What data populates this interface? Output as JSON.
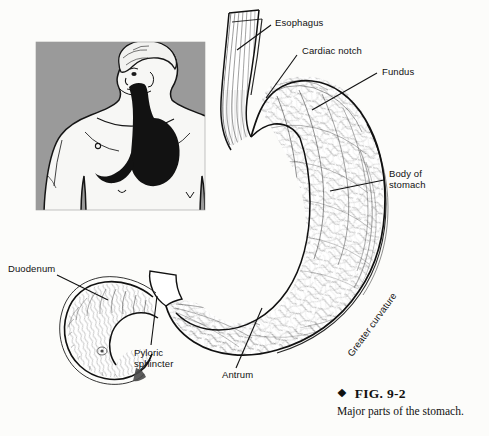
{
  "figure": {
    "title": "Major parts of the stomach",
    "caption_marker": "❖",
    "caption_number": "FIG. 9-2",
    "caption_text": "Major parts of the stomach.",
    "background_color": "#fcfcfa",
    "ink_color": "#111111",
    "inset_background_color": "#9a9a9a"
  },
  "labels": {
    "esophagus": "Esophagus",
    "cardiac_notch": "Cardiac notch",
    "fundus": "Fundus",
    "body_of_stomach": "Body of\nstomach",
    "greater_curvature": "Greater curvature",
    "antrum": "Antrum",
    "pyloric_sphincter": "Pyloric\nsphincter",
    "duodenum": "Duodenum"
  },
  "inset": {
    "name": "human torso orientation inset",
    "description": "Gray panel showing a human torso with esophagus and stomach shaded black"
  },
  "structures": [
    {
      "id": "esophagus",
      "name": "Esophagus"
    },
    {
      "id": "cardiac-notch",
      "name": "Cardiac notch"
    },
    {
      "id": "fundus",
      "name": "Fundus"
    },
    {
      "id": "body",
      "name": "Body of stomach"
    },
    {
      "id": "greater-curvature",
      "name": "Greater curvature"
    },
    {
      "id": "antrum",
      "name": "Antrum"
    },
    {
      "id": "pyloric-sphincter",
      "name": "Pyloric sphincter"
    },
    {
      "id": "duodenum",
      "name": "Duodenum"
    }
  ]
}
